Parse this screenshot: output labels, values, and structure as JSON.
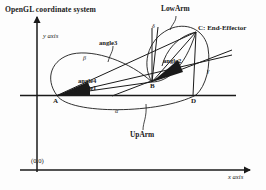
{
  "diagram": {
    "title": "OpenGL coordinate system",
    "axes": {
      "y_label": "y axis",
      "x_label": "x axis",
      "origin_label": "(0,0)"
    },
    "points": [
      {
        "id": "A",
        "label": "A",
        "x": 57,
        "y": 95
      },
      {
        "id": "B",
        "label": "B",
        "x": 152,
        "y": 82
      },
      {
        "id": "C",
        "label": "C:  End-Effector",
        "x": 196,
        "y": 32
      },
      {
        "id": "D",
        "label": "D",
        "x": 193,
        "y": 95
      }
    ],
    "links": [
      {
        "name": "UpArm",
        "label": "UpArm"
      },
      {
        "name": "LowArm",
        "label": "LowArm"
      }
    ],
    "angles": [
      {
        "label": "angle1"
      },
      {
        "label": "angle2"
      },
      {
        "label": "angle3"
      },
      {
        "label": "angle4"
      }
    ],
    "greek_marks": [
      {
        "label": "β"
      },
      {
        "label": "α"
      },
      {
        "label": "γ"
      },
      {
        "label": "δ"
      }
    ],
    "colors": {
      "ink": "#1a1a1a",
      "background": "#fdfdfd"
    }
  }
}
